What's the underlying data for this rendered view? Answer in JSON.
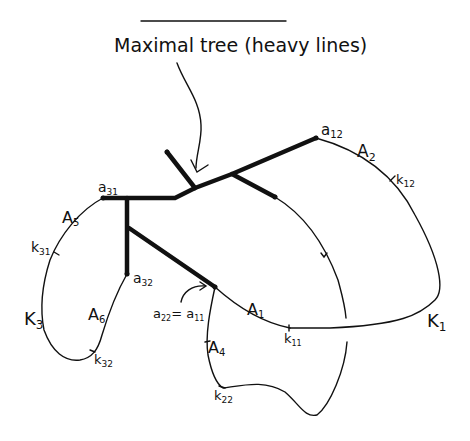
{
  "title": "Maximal tree (heavy lines)",
  "labels": {
    "a12": "a",
    "a12_sub": "12",
    "A2": "A",
    "A2_sub": "2",
    "k12": "k",
    "k12_sub": "12",
    "a31": "a",
    "a31_sub": "31",
    "A5": "A",
    "A5_sub": "5",
    "k31": "k",
    "k31_sub": "31",
    "a32": "a",
    "a32_sub": "32",
    "K3": "K",
    "K3_sub": "3",
    "A6": "A",
    "A6_sub": "6",
    "k32": "k",
    "k32_sub": "32",
    "a22_eq": "a",
    "a22_sub": "22",
    "eq": "= a",
    "a11_sub": "11",
    "A1": "A",
    "A1_sub": "1",
    "k11": "k",
    "k11_sub": "11",
    "A4": "A",
    "A4_sub": "4",
    "k22": "k",
    "k22_sub": "22",
    "K1": "K",
    "K1_sub": "1"
  }
}
